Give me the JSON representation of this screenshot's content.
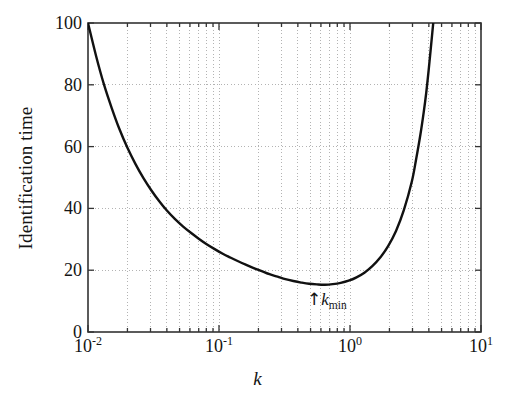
{
  "chart_data": {
    "type": "line",
    "title": "",
    "subtitle": "",
    "xlabel": "k",
    "ylabel": "Identification time",
    "xscale": "log",
    "yscale": "linear",
    "xlim": [
      0.01,
      10
    ],
    "ylim": [
      0,
      100
    ],
    "grid": true,
    "grid_style": "dotted",
    "grid_color": "#b3b3b3",
    "legend": null,
    "legend_position": "none",
    "xticks": [
      {
        "value": 0.01,
        "label": "10",
        "exponent": "-2"
      },
      {
        "value": 0.1,
        "label": "10",
        "exponent": "-1"
      },
      {
        "value": 1,
        "label": "10",
        "exponent": "0"
      },
      {
        "value": 10,
        "label": "10",
        "exponent": "1"
      }
    ],
    "yticks": [
      0,
      20,
      40,
      60,
      80,
      100
    ],
    "minor_xticks": true,
    "series": [
      {
        "name": "Identification time",
        "color": "#111111",
        "linewidth": 2.4,
        "x": [
          0.01,
          0.0115,
          0.0132,
          0.0152,
          0.0174,
          0.02,
          0.023,
          0.0265,
          0.0305,
          0.035,
          0.04,
          0.046,
          0.053,
          0.061,
          0.07,
          0.08,
          0.092,
          0.106,
          0.122,
          0.14,
          0.16,
          0.184,
          0.212,
          0.243,
          0.28,
          0.321,
          0.369,
          0.424,
          0.487,
          0.56,
          0.643,
          0.739,
          0.849,
          0.976,
          1.121,
          1.288,
          1.48,
          1.701,
          1.954,
          2.245,
          2.58,
          2.965,
          3.2,
          3.45,
          3.65,
          3.82,
          3.98,
          4.12,
          4.23,
          4.32
        ],
        "y": [
          100.0,
          89.5,
          80.3,
          72.4,
          65.6,
          59.6,
          54.4,
          49.8,
          45.8,
          42.3,
          39.3,
          36.6,
          34.2,
          32.1,
          30.2,
          28.5,
          26.9,
          25.4,
          24.1,
          22.9,
          21.8,
          20.7,
          19.7,
          18.7,
          17.9,
          17.1,
          16.5,
          16.0,
          15.6,
          15.4,
          15.3,
          15.5,
          15.9,
          16.6,
          17.7,
          19.2,
          21.3,
          24.1,
          27.8,
          32.7,
          39.5,
          48.7,
          56.0,
          64.0,
          71.0,
          77.5,
          84.5,
          91.0,
          96.0,
          100.0
        ]
      }
    ],
    "annotations": [
      {
        "name": "k-min-marker",
        "arrow": "↑",
        "symbol": "k",
        "subscript": "min",
        "x_value": 0.55,
        "y_value": 10.5,
        "text": "↑k_min"
      }
    ]
  },
  "plot_box": {
    "left": 88,
    "top": 23,
    "right": 481,
    "bottom": 332,
    "border_color": "#333333",
    "background": "#ffffff"
  }
}
